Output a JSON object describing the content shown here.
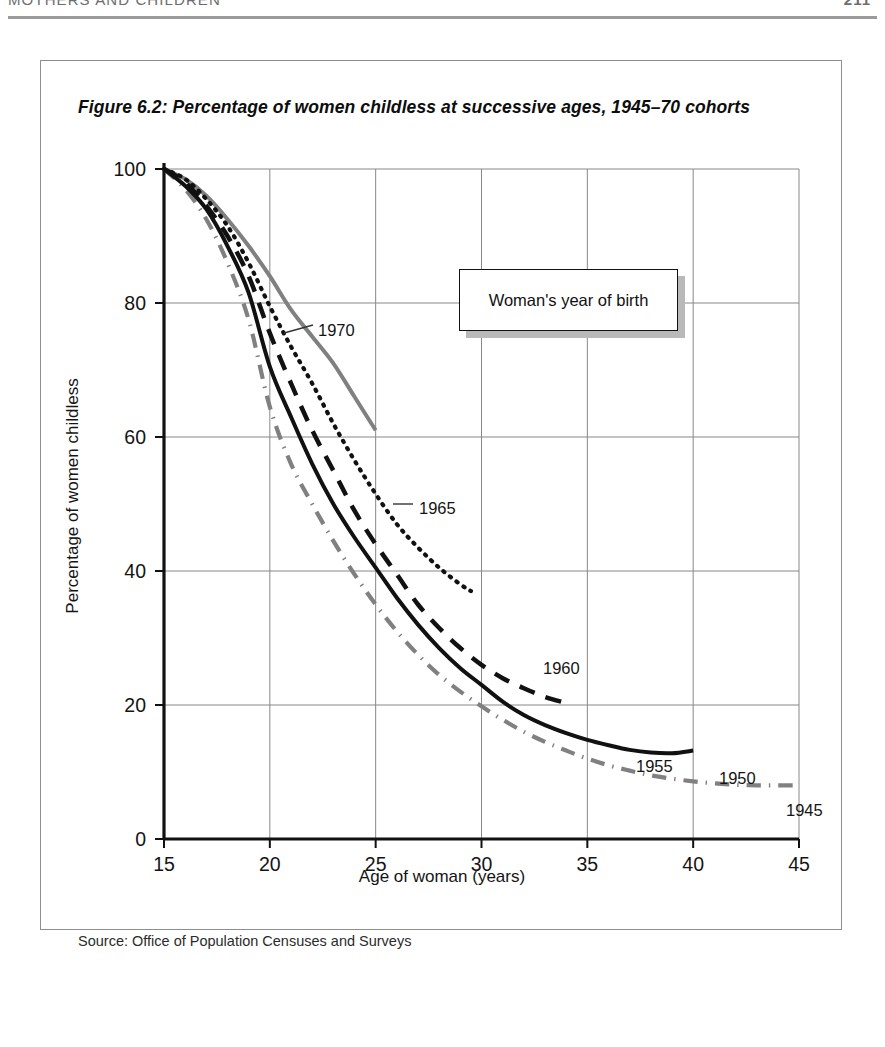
{
  "page": {
    "running_head": "MOTHERS AND CHILDREN",
    "folio": "211"
  },
  "figure": {
    "title": "Figure 6.2:    Percentage of women childless at successive ages, 1945–70 cohorts",
    "source": "Source: Office of Population Censuses and Surveys",
    "legend_title": "Woman's year of birth"
  },
  "chart_data": {
    "type": "line",
    "title": "Percentage of women childless at successive ages, 1945–70 cohorts",
    "xlabel": "Age of woman (years)",
    "ylabel": "Percentage of women childless",
    "xlim": [
      15,
      45
    ],
    "ylim": [
      0,
      100
    ],
    "xticks": [
      "15",
      "20",
      "25",
      "30",
      "35",
      "40",
      "45"
    ],
    "yticks": [
      "0",
      "20",
      "40",
      "60",
      "80",
      "100"
    ],
    "grid": true,
    "legend_position": "inside-top-right",
    "legend_title": "Woman's year of birth",
    "source": "Office of Population Censuses and Surveys",
    "series": [
      {
        "name": "1970",
        "style": "solid",
        "color": "#808080",
        "width": 4.0,
        "label_x": 277,
        "label_y": 260,
        "leader": [
          [
            243,
            272
          ],
          [
            272,
            264
          ]
        ],
        "x": [
          15,
          16,
          17,
          18,
          19,
          20,
          21,
          22,
          23,
          24,
          25
        ],
        "y": [
          100,
          98.5,
          96,
          92.5,
          88.5,
          84,
          79,
          75,
          71,
          66,
          61
        ]
      },
      {
        "name": "1965",
        "style": "solid",
        "color": "#808080",
        "width": 4.0,
        "label_x": 378,
        "label_y": 438,
        "leader": [
          [
            352,
            443
          ],
          [
            372,
            443
          ]
        ],
        "x": [
          15,
          16,
          17,
          18,
          19,
          20,
          21,
          22,
          23,
          24,
          25
        ],
        "y": [
          100,
          98.5,
          96,
          92.5,
          88.5,
          84,
          79,
          75,
          71,
          66,
          61
        ]
      },
      {
        "name": "1960",
        "style": "dotted",
        "color": "#111111",
        "width": 4.2,
        "label_x": 502,
        "label_y": 598,
        "leader": null,
        "x": [
          15,
          16,
          17,
          18,
          19,
          20,
          21,
          22,
          23,
          24,
          25,
          26,
          27,
          28,
          29,
          29.5
        ],
        "y": [
          100,
          98.5,
          95.5,
          91.5,
          86,
          79.5,
          73.5,
          68,
          62,
          56.5,
          51.5,
          47,
          43.5,
          40.5,
          38,
          37
        ]
      },
      {
        "name": "1955",
        "style": "dashed",
        "color": "#111111",
        "width": 4.5,
        "label_x": 595,
        "label_y": 696,
        "leader": null,
        "x": [
          15,
          16,
          17,
          18,
          19,
          20,
          21,
          22,
          23,
          24,
          25,
          26,
          27,
          28,
          29,
          30,
          31,
          32,
          33,
          34
        ],
        "y": [
          100,
          98,
          94.5,
          90,
          84,
          75.5,
          68,
          61,
          55,
          49,
          44,
          39.5,
          35,
          31.5,
          28.5,
          26,
          24,
          22.5,
          21.2,
          20.3
        ]
      },
      {
        "name": "1950",
        "style": "solid",
        "color": "#111111",
        "width": 4.0,
        "label_x": 678,
        "label_y": 708,
        "leader": null,
        "x": [
          15,
          16,
          17,
          18,
          19,
          20,
          21,
          22,
          23,
          24,
          25,
          26,
          27,
          28,
          29,
          30,
          31,
          32,
          33,
          34,
          35,
          36,
          37,
          38,
          39,
          40
        ],
        "y": [
          100,
          97.5,
          94,
          88.5,
          81.5,
          70.5,
          63,
          56,
          50,
          45,
          40.5,
          36,
          32,
          28.5,
          25.5,
          23,
          20.5,
          18.5,
          17,
          15.8,
          14.8,
          14,
          13.3,
          12.9,
          12.8,
          13.2
        ]
      },
      {
        "name": "1945",
        "style": "dashdot",
        "color": "#808080",
        "width": 4.2,
        "label_x": 745,
        "label_y": 740,
        "leader": null,
        "x": [
          15,
          16,
          17,
          18,
          19,
          20,
          21,
          22,
          23,
          24,
          25,
          26,
          27,
          28,
          29,
          30,
          31,
          32,
          33,
          34,
          35,
          36,
          37,
          38,
          39,
          40,
          41,
          42,
          43,
          44,
          45
        ],
        "y": [
          100,
          97,
          92.5,
          86,
          77.5,
          64.5,
          56,
          50,
          44.5,
          39.5,
          35,
          31,
          27.5,
          24.5,
          22,
          19.8,
          17.8,
          16,
          14.5,
          13.2,
          12,
          11,
          10.2,
          9.5,
          9,
          8.6,
          8.3,
          8.1,
          8.0,
          8.0,
          8.0
        ]
      }
    ]
  }
}
